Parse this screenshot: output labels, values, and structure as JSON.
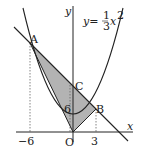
{
  "figure": {
    "equation": {
      "lhs": "y=",
      "num": "1",
      "den": "3",
      "var": "x",
      "exp": "2"
    },
    "axes": {
      "x_label": "x",
      "y_label": "y",
      "origin_label": "O"
    },
    "points": {
      "A": "A",
      "B": "B",
      "C": "C"
    },
    "ticks": {
      "x_neg": "−6",
      "x_pos": "3",
      "y_c": "6"
    },
    "colors": {
      "stroke": "#222222",
      "fill": "#b3b3b3"
    }
  }
}
